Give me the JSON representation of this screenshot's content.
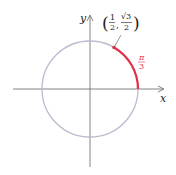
{
  "diagram": {
    "axes": {
      "x_label": "x",
      "y_label": "y"
    },
    "point_label": {
      "open": "(",
      "x_num": "1",
      "x_den": "2",
      "comma": ",",
      "y_num": "√3",
      "y_den": "2",
      "close": ")"
    },
    "arc_label": {
      "num": "π",
      "den": "3"
    },
    "colors": {
      "circle": "#b9b6cc",
      "arc": "#e0304a",
      "axis": "#555555",
      "label": "#222222"
    }
  }
}
